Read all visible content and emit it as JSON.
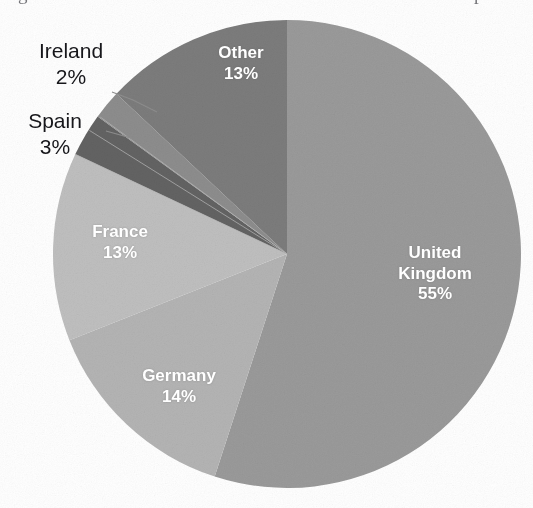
{
  "page": {
    "caption_remnant_left": "g",
    "caption_remnant_right": "p",
    "background_color": "#ffffff"
  },
  "chart_data": {
    "type": "pie",
    "title": "",
    "subtitle": "",
    "xlabel": "",
    "ylabel": "",
    "legend_position": "none",
    "grid": false,
    "units": "percent",
    "total": 100,
    "start_angle_deg": 0,
    "direction": "clockwise",
    "categories": [
      "United Kingdom",
      "Germany",
      "France",
      "Spain",
      "Ireland",
      "Other"
    ],
    "values": [
      55,
      14,
      13,
      3,
      2,
      13
    ],
    "labels": [
      "55%",
      "14%",
      "13%",
      "3%",
      "2%",
      "13%"
    ],
    "colors": [
      "#9a9a9a",
      "#b4b4b4",
      "#bfbfbf",
      "#636363",
      "#8d8d8d",
      "#7b7b7b"
    ],
    "slices": [
      {
        "name": "United Kingdom",
        "value": 55,
        "label": "United Kingdom",
        "label_line1": "United",
        "label_line2": "Kingdom",
        "percent_text": "55%",
        "color": "#9a9a9a",
        "label_placement": "inside"
      },
      {
        "name": "Germany",
        "value": 14,
        "label": "Germany",
        "percent_text": "14%",
        "color": "#b4b4b4",
        "label_placement": "inside"
      },
      {
        "name": "France",
        "value": 13,
        "label": "France",
        "percent_text": "13%",
        "color": "#bfbfbf",
        "label_placement": "inside"
      },
      {
        "name": "Spain",
        "value": 3,
        "label": "Spain",
        "percent_text": "3%",
        "color": "#636363",
        "label_placement": "outside"
      },
      {
        "name": "Ireland",
        "value": 2,
        "label": "Ireland",
        "percent_text": "2%",
        "color": "#8d8d8d",
        "label_placement": "outside"
      },
      {
        "name": "Other",
        "value": 13,
        "label": "Other",
        "percent_text": "13%",
        "color": "#7b7b7b",
        "label_placement": "inside"
      }
    ]
  }
}
